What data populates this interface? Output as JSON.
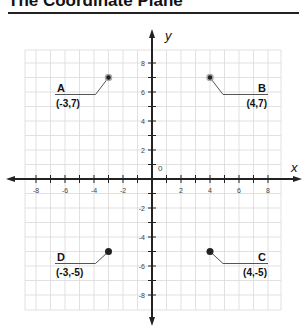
{
  "title": "The Coordinate Plane",
  "chart_data": {
    "type": "scatter",
    "title": "The Coordinate Plane",
    "xlabel": "x",
    "ylabel": "y",
    "xlim": [
      -9,
      9
    ],
    "ylim": [
      -9,
      9
    ],
    "grid": true,
    "origin_label": "0",
    "x_ticks": [
      -8,
      -6,
      -4,
      -2,
      2,
      4,
      6,
      8
    ],
    "y_ticks": [
      -8,
      -6,
      -4,
      -2,
      2,
      4,
      6,
      8
    ],
    "points": [
      {
        "name": "A",
        "x": -3,
        "y": 7,
        "label": "(-3,7)"
      },
      {
        "name": "B",
        "x": 4,
        "y": 7,
        "label": "(4,7)"
      },
      {
        "name": "C",
        "x": 4,
        "y": -5,
        "label": "(4,-5)"
      },
      {
        "name": "D",
        "x": -3,
        "y": -5,
        "label": "(-3,-5)"
      }
    ]
  },
  "colors": {
    "grid": "#d9d9d9",
    "axis": "#222222",
    "leader": "#555555",
    "point": "#222222"
  }
}
